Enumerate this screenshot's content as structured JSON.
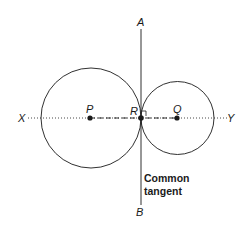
{
  "diagram": {
    "labels": {
      "A": "A",
      "B": "B",
      "X": "X",
      "Y": "Y",
      "P": "P",
      "Q": "Q",
      "R": "R"
    },
    "annotation": {
      "line1": "Common",
      "line2": "tangent"
    },
    "colors": {
      "stroke": "#1a1a1a",
      "background": "#ffffff"
    }
  }
}
